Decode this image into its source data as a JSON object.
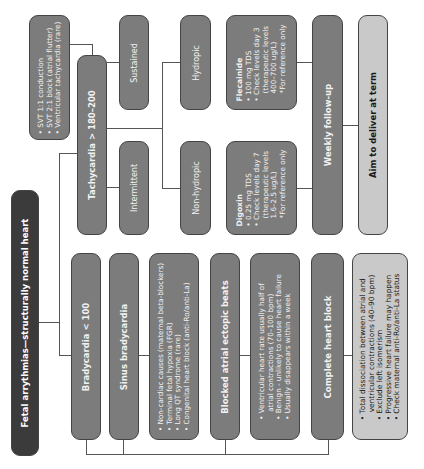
{
  "diagram": {
    "root": {
      "label": "Fetal arrythmias—structurally normal heart"
    },
    "tachycardia": {
      "label": "Tachycardia > 180–200",
      "causes": [
        "SVT 1:1 conduction",
        "SVT 2:1 block (atrial flutter)",
        "Ventricular tachycardia (rare)"
      ],
      "sustained": "Sustained",
      "intermittent": "Intermittent",
      "hydropic": "Hydropic",
      "non_hydropic": "Non-hydropic",
      "flecainide": {
        "title": "Flecainide",
        "items": [
          "100 mg TDS",
          "Check levels day 3",
          "(therapeutic levels",
          "400–700 ug/L)",
          "*For reference only"
        ]
      },
      "digoxin": {
        "title": "Digoxin",
        "items": [
          "0.25 mg TDS",
          "Check levels day 7",
          "(therapeutic levels",
          "1.6–2.5 ug/L)",
          "*For reference only"
        ]
      },
      "weekly": "Weekly follow-up",
      "deliver": "Aim to deliver at term"
    },
    "bradycardia": {
      "label": "Bradycardia < 100",
      "sinus": {
        "label": "Sinus bradycardia",
        "items": [
          "Non-cardiac causes (maternal beta-blockers)",
          "Terminal fetal hypoxia (FGR)",
          "Long QT syndrome (rare)",
          "Congenital heart block (anti-Ro/anti-La)"
        ]
      },
      "blocked": {
        "label": "Blocked atrial ectopic beats",
        "items": [
          "Ventricular heart rate usually half of",
          "atrial contractions (70–100 bpm)",
          "Benign - unlikely to cause heart failure",
          "Usually disappears within a week"
        ]
      },
      "complete": {
        "label": "Complete heart block",
        "items": [
          "Total dissociation between atrial and",
          "ventricular contractions (40–90 bpm)",
          "Exclude left isomerism",
          "Progressive heart failure may happen",
          "Check maternal anti-Ro/anti-La status"
        ]
      }
    },
    "colors": {
      "dark": "#3b3b3b",
      "mid": "#7c7c7c",
      "light": "#c9c9c9",
      "line": "#555555"
    }
  }
}
